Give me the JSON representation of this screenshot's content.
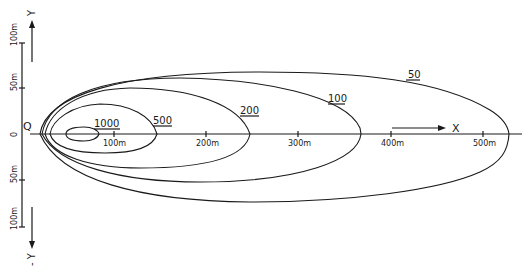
{
  "diagram": {
    "origin_label": "Q",
    "x_axis": {
      "label": "X",
      "ticks": [
        "100m",
        "200m",
        "300m",
        "400m",
        "500m"
      ]
    },
    "y_axis": {
      "positive_label": "Y",
      "negative_label": "- Y",
      "origin_tick": "0",
      "ticks_up": [
        "50m",
        "100m"
      ],
      "ticks_down": [
        "50m",
        "100m"
      ]
    },
    "contours": [
      {
        "value": "1000"
      },
      {
        "value": "500"
      },
      {
        "value": "200"
      },
      {
        "value": "100"
      },
      {
        "value": "50"
      }
    ],
    "colors": {
      "ink": "#1a1a1a",
      "background": "#ffffff"
    }
  }
}
